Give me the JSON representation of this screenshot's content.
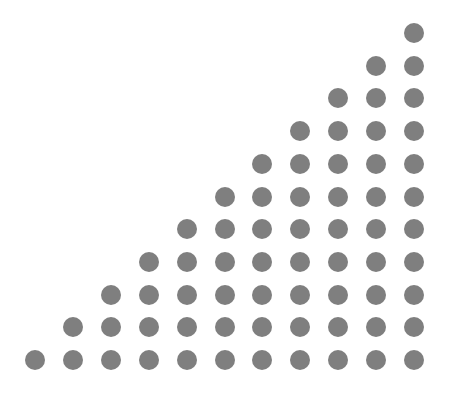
{
  "figure": {
    "columns": 11,
    "rows": 11,
    "dot_color": "#7f7f7f",
    "background": "#ffffff",
    "dot_diameter": 20,
    "origin_x": 35,
    "origin_y": 360,
    "col_spacing": 37.9,
    "row_spacing": 32.7,
    "dots_per_column": [
      1,
      2,
      3,
      4,
      5,
      6,
      7,
      8,
      9,
      10,
      11
    ],
    "total_dots": 66
  }
}
